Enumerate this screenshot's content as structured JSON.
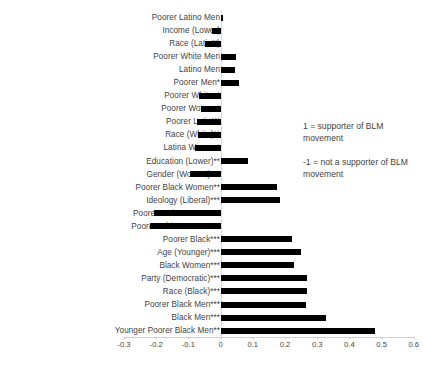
{
  "chart_data": {
    "type": "bar",
    "orientation": "horizontal",
    "title": "",
    "xlabel": "",
    "ylabel": "",
    "xlim": [
      -0.3,
      0.6
    ],
    "xticks": [
      -0.3,
      -0.2,
      -0.1,
      0,
      0.1,
      0.2,
      0.3,
      0.4,
      0.5,
      0.6
    ],
    "xtick_labels": [
      "-0.3",
      "-0.2",
      "-0.1",
      "0",
      "0.1",
      "0.2",
      "0.3",
      "0.4",
      "0.5",
      "0.6"
    ],
    "grid": false,
    "legend": "none",
    "bar_color": "#000000",
    "categories": [
      "Poorer Latino Men",
      "Income (Lower)",
      "Race (LatinX)",
      "Poorer White Men",
      "Latino Men",
      "Poorer Men*",
      "Poorer Whites*",
      "Poorer Women*",
      "Poorer LatinX*",
      "Race (White)**",
      "Latina Women*",
      "Education (Lower)**",
      "Gender (Women)***",
      "Poorer Black Women**",
      "Ideology (Liberal)***",
      "Poorer Latina Women**",
      "Poorer White Women***",
      "Poorer Black***",
      "Age (Younger)***",
      "Black Women***",
      "Party (Democratic)***",
      "Race (Black)***",
      "Poorer Black Men***",
      "Black Men***",
      "Younger Poorer Black Men**"
    ],
    "values": [
      0.006,
      -0.027,
      -0.048,
      0.047,
      0.046,
      0.058,
      -0.066,
      -0.062,
      -0.073,
      -0.071,
      -0.081,
      0.086,
      -0.096,
      0.176,
      0.184,
      -0.206,
      -0.218,
      0.221,
      0.249,
      0.228,
      0.268,
      0.268,
      0.266,
      0.326,
      0.478
    ],
    "annotations": [
      "1 = supporter of BLM movement",
      "-1 = not a supporter of BLM movement"
    ]
  },
  "notes": {
    "positive": "1 = supporter of BLM movement",
    "negative": "-1 = not a supporter of BLM movement"
  }
}
